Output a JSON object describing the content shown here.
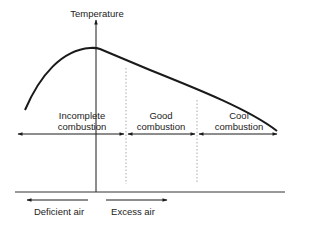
{
  "diagram": {
    "y_axis_label": "Temperature",
    "zones": [
      {
        "id": "incomplete",
        "line1": "Incomplete",
        "line2": "combustion"
      },
      {
        "id": "good",
        "line1": "Good",
        "line2": "combustion"
      },
      {
        "id": "cool",
        "line1": "Cool",
        "line2": "combustion"
      }
    ],
    "x_directions": {
      "left": "Deficient air",
      "right": "Excess air"
    },
    "colors": {
      "line": "#1a1a1a",
      "dotted": "#aaaaaa"
    }
  }
}
